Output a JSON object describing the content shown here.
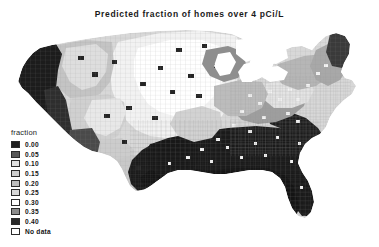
{
  "figure": {
    "title": "Predicted fraction of homes over 4 pCi/L",
    "background_color": "#ffffff"
  },
  "legend": {
    "title": "fraction",
    "entries": [
      {
        "label": "0.00",
        "color": "#1f1f1f"
      },
      {
        "label": "0.05",
        "color": "#575757"
      },
      {
        "label": "0.10",
        "color": "#e0e0e0"
      },
      {
        "label": "0.15",
        "color": "#cfcfcf"
      },
      {
        "label": "0.20",
        "color": "#bdbdbd"
      },
      {
        "label": "0.25",
        "color": "#d6d6d6"
      },
      {
        "label": "0.30",
        "color": "#ffffff"
      },
      {
        "label": "0.35",
        "color": "#8c8c8c"
      },
      {
        "label": "0.40",
        "color": "#2a2a2a"
      },
      {
        "label": "No data",
        "color": "#ffffff"
      }
    ]
  },
  "chart_data": {
    "type": "heatmap",
    "title": "Predicted fraction of homes over 4 pCi/L",
    "subtitle": "",
    "xlabel": "",
    "ylabel": "",
    "grid": false,
    "legend_position": "left-bottom",
    "variable": "fraction of homes over 4 pCi/L",
    "unit": "fraction",
    "geography": "United States counties (contiguous 48 states)",
    "scale_values": [
      0.0,
      0.05,
      0.1,
      0.15,
      0.2,
      0.25,
      0.3,
      0.35,
      0.4
    ],
    "no_data_label": "No data",
    "regions": [
      {
        "name": "Pacific Northwest Coast",
        "value": 0.0,
        "color": "#1f1f1f"
      },
      {
        "name": "California Coast",
        "value": 0.0,
        "color": "#1f1f1f"
      },
      {
        "name": "Northern Rockies",
        "value": 0.2,
        "color": "#bdbdbd"
      },
      {
        "name": "Idaho / Eastern Washington",
        "value": 0.25,
        "color": "#d6d6d6"
      },
      {
        "name": "Montana",
        "value": 0.2,
        "color": "#bdbdbd"
      },
      {
        "name": "Wyoming",
        "value": 0.2,
        "color": "#bdbdbd"
      },
      {
        "name": "Colorado",
        "value": 0.25,
        "color": "#d6d6d6"
      },
      {
        "name": "Utah",
        "value": 0.15,
        "color": "#cfcfcf"
      },
      {
        "name": "Nevada",
        "value": 0.1,
        "color": "#e0e0e0"
      },
      {
        "name": "Arizona",
        "value": 0.05,
        "color": "#575757"
      },
      {
        "name": "New Mexico",
        "value": 0.15,
        "color": "#cfcfcf"
      },
      {
        "name": "North Dakota",
        "value": 0.3,
        "color": "#ffffff"
      },
      {
        "name": "South Dakota",
        "value": 0.3,
        "color": "#ffffff"
      },
      {
        "name": "Nebraska",
        "value": 0.3,
        "color": "#ffffff"
      },
      {
        "name": "Kansas",
        "value": 0.25,
        "color": "#d6d6d6"
      },
      {
        "name": "Iowa",
        "value": 0.3,
        "color": "#ffffff"
      },
      {
        "name": "Minnesota",
        "value": 0.25,
        "color": "#d6d6d6"
      },
      {
        "name": "Wisconsin",
        "value": 0.2,
        "color": "#bdbdbd"
      },
      {
        "name": "Illinois",
        "value": 0.2,
        "color": "#bdbdbd"
      },
      {
        "name": "Indiana / Ohio",
        "value": 0.15,
        "color": "#cfcfcf"
      },
      {
        "name": "Missouri",
        "value": 0.1,
        "color": "#e0e0e0"
      },
      {
        "name": "Oklahoma",
        "value": 0.1,
        "color": "#e0e0e0"
      },
      {
        "name": "West Texas",
        "value": 0.15,
        "color": "#cfcfcf"
      },
      {
        "name": "East Texas",
        "value": 0.0,
        "color": "#1f1f1f"
      },
      {
        "name": "Gulf Coast",
        "value": 0.0,
        "color": "#1f1f1f"
      },
      {
        "name": "Deep South",
        "value": 0.0,
        "color": "#1f1f1f"
      },
      {
        "name": "Florida",
        "value": 0.0,
        "color": "#1f1f1f"
      },
      {
        "name": "Appalachians",
        "value": 0.2,
        "color": "#bdbdbd"
      },
      {
        "name": "Pennsylvania",
        "value": 0.3,
        "color": "#ffffff"
      },
      {
        "name": "New York",
        "value": 0.15,
        "color": "#cfcfcf"
      },
      {
        "name": "New England",
        "value": 0.15,
        "color": "#cfcfcf"
      },
      {
        "name": "Maine",
        "value": 0.05,
        "color": "#575757"
      },
      {
        "name": "Atlantic Coastal Plain",
        "value": 0.0,
        "color": "#1f1f1f"
      },
      {
        "name": "Great Lakes (water)",
        "value": null,
        "color": "#ffffff"
      }
    ]
  }
}
